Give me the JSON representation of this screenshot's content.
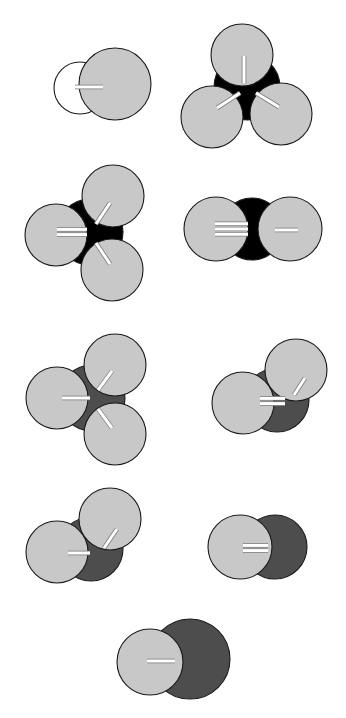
{
  "figure": {
    "background_color": "#ffffff",
    "width": 346,
    "height": 718,
    "palette": {
      "hydrogen_white": "#ffffff",
      "light_gray": "#c8c8c8",
      "dark_gray": "#4d4d4d",
      "black": "#000000",
      "outline": "#1a1a1a",
      "bond_white": "#ffffff",
      "bond_shadow": "#808080"
    },
    "structures": [
      {
        "id": "structure-1",
        "label": "diatomic-white-lightgray",
        "row": 1,
        "column": "left",
        "center_color": "#ffffff",
        "bond_orders": [
          1
        ],
        "atom_count": 2,
        "atoms": [
          {
            "name": "atom-white-left",
            "cx": 80,
            "cy": 88,
            "r": 26,
            "fill": "#ffffff",
            "z": 1
          },
          {
            "name": "atom-lightgray-right",
            "cx": 115,
            "cy": 84,
            "r": 36,
            "fill": "#c8c8c8",
            "z": 2
          }
        ],
        "bonds": [
          {
            "name": "bond-single-right",
            "order": 1,
            "x1": 75,
            "y1": 87,
            "x2": 103,
            "y2": 87,
            "angle": 0
          }
        ]
      },
      {
        "id": "structure-2",
        "label": "black-center-three-lightgray-trigonal",
        "row": 1,
        "column": "right",
        "center_color": "#000000",
        "bond_orders": [
          1,
          1,
          1
        ],
        "atom_count": 4,
        "atoms": [
          {
            "name": "atom-center-black",
            "cx": 247,
            "cy": 87,
            "r": 33,
            "fill": "#000000",
            "z": 1
          },
          {
            "name": "atom-lightgray-top",
            "cx": 242,
            "cy": 55,
            "r": 31,
            "fill": "#c8c8c8",
            "z": 2
          },
          {
            "name": "atom-lightgray-lower-left",
            "cx": 212,
            "cy": 117,
            "r": 31,
            "fill": "#c8c8c8",
            "z": 2
          },
          {
            "name": "atom-lightgray-lower-right",
            "cx": 281,
            "cy": 114,
            "r": 31,
            "fill": "#c8c8c8",
            "z": 2
          }
        ],
        "bonds": [
          {
            "name": "bond-single-top",
            "order": 1,
            "x1": 244,
            "y1": 83,
            "x2": 244,
            "y2": 56,
            "angle": 90
          },
          {
            "name": "bond-single-lower-left",
            "order": 1,
            "x1": 240,
            "y1": 93,
            "x2": 217,
            "y2": 108,
            "angle": 213
          },
          {
            "name": "bond-single-lower-right",
            "order": 1,
            "x1": 256,
            "y1": 93,
            "x2": 279,
            "y2": 107,
            "angle": 328
          }
        ]
      },
      {
        "id": "structure-3",
        "label": "black-center-double-bond-three-lightgray",
        "row": 2,
        "column": "left",
        "center_color": "#000000",
        "bond_orders": [
          2,
          1,
          1
        ],
        "atom_count": 4,
        "atoms": [
          {
            "name": "atom-center-black",
            "cx": 90,
            "cy": 232,
            "r": 33,
            "fill": "#000000",
            "z": 1
          },
          {
            "name": "atom-lightgray-left",
            "cx": 56,
            "cy": 235,
            "r": 31,
            "fill": "#c8c8c8",
            "z": 2
          },
          {
            "name": "atom-lightgray-upper-right",
            "cx": 113,
            "cy": 196,
            "r": 31,
            "fill": "#c8c8c8",
            "z": 2
          },
          {
            "name": "atom-lightgray-lower-right",
            "cx": 112,
            "cy": 270,
            "r": 31,
            "fill": "#c8c8c8",
            "z": 2
          }
        ],
        "bonds": [
          {
            "name": "bond-double-left",
            "order": 2,
            "x1": 57,
            "y1": 232,
            "x2": 87,
            "y2": 232,
            "angle": 180
          },
          {
            "name": "bond-single-upper-right",
            "order": 1,
            "x1": 96,
            "y1": 224,
            "x2": 110,
            "y2": 203,
            "angle": 56
          },
          {
            "name": "bond-single-lower-right",
            "order": 1,
            "x1": 96,
            "y1": 243,
            "x2": 110,
            "y2": 264,
            "angle": 304
          }
        ]
      },
      {
        "id": "structure-4",
        "label": "linear-black-center-triple-and-single",
        "row": 2,
        "column": "right",
        "center_color": "#000000",
        "bond_orders": [
          3,
          1
        ],
        "atom_count": 3,
        "atoms": [
          {
            "name": "atom-center-black",
            "cx": 252,
            "cy": 229,
            "r": 31,
            "fill": "#000000",
            "z": 1
          },
          {
            "name": "atom-lightgray-left",
            "cx": 216,
            "cy": 229,
            "r": 32,
            "fill": "#c8c8c8",
            "z": 2
          },
          {
            "name": "atom-lightgray-right",
            "cx": 290,
            "cy": 229,
            "r": 32,
            "fill": "#c8c8c8",
            "z": 2
          }
        ],
        "bonds": [
          {
            "name": "bond-triple-left",
            "order": 3,
            "x1": 215,
            "y1": 229,
            "x2": 248,
            "y2": 229,
            "angle": 180
          },
          {
            "name": "bond-single-right",
            "order": 1,
            "x1": 275,
            "y1": 230,
            "x2": 298,
            "y2": 230,
            "angle": 0
          }
        ]
      },
      {
        "id": "structure-5",
        "label": "darkgray-center-three-lightgray",
        "row": 3,
        "column": "left",
        "center_color": "#4d4d4d",
        "bond_orders": [
          1,
          1,
          1
        ],
        "atom_count": 4,
        "atoms": [
          {
            "name": "atom-center-darkgray",
            "cx": 92,
            "cy": 398,
            "r": 33,
            "fill": "#4d4d4d",
            "z": 1
          },
          {
            "name": "atom-lightgray-left",
            "cx": 57,
            "cy": 398,
            "r": 31,
            "fill": "#c8c8c8",
            "z": 2
          },
          {
            "name": "atom-lightgray-upper-right",
            "cx": 115,
            "cy": 365,
            "r": 31,
            "fill": "#c8c8c8",
            "z": 2
          },
          {
            "name": "atom-lightgray-lower-right",
            "cx": 115,
            "cy": 434,
            "r": 31,
            "fill": "#c8c8c8",
            "z": 2
          }
        ],
        "bonds": [
          {
            "name": "bond-single-left",
            "order": 1,
            "x1": 62,
            "y1": 398,
            "x2": 90,
            "y2": 398,
            "angle": 180
          },
          {
            "name": "bond-single-upper-right",
            "order": 1,
            "x1": 98,
            "y1": 390,
            "x2": 112,
            "y2": 371,
            "angle": 54
          },
          {
            "name": "bond-single-lower-right",
            "order": 1,
            "x1": 98,
            "y1": 409,
            "x2": 112,
            "y2": 428,
            "angle": 306
          }
        ]
      },
      {
        "id": "structure-6",
        "label": "darkgray-double-bond-two-lightgray",
        "row": 3,
        "column": "right",
        "center_color": "#4d4d4d",
        "bond_orders": [
          2,
          1
        ],
        "atom_count": 3,
        "atoms": [
          {
            "name": "atom-center-darkgray",
            "cx": 277,
            "cy": 400,
            "r": 32,
            "fill": "#4d4d4d",
            "z": 1
          },
          {
            "name": "atom-lightgray-left",
            "cx": 243,
            "cy": 403,
            "r": 31,
            "fill": "#c8c8c8",
            "z": 2
          },
          {
            "name": "atom-lightgray-upper-right",
            "cx": 296,
            "cy": 370,
            "r": 31,
            "fill": "#c8c8c8",
            "z": 2
          }
        ],
        "bonds": [
          {
            "name": "bond-double-left",
            "order": 2,
            "x1": 260,
            "y1": 401,
            "x2": 285,
            "y2": 401,
            "angle": 180
          },
          {
            "name": "bond-single-upper-right",
            "order": 1,
            "x1": 294,
            "y1": 395,
            "x2": 305,
            "y2": 378,
            "angle": 57
          }
        ]
      },
      {
        "id": "structure-7",
        "label": "darkgray-two-lightgray-single-bonds",
        "row": 4,
        "column": "left",
        "center_color": "#4d4d4d",
        "bond_orders": [
          1,
          1
        ],
        "atom_count": 3,
        "atoms": [
          {
            "name": "atom-center-darkgray",
            "cx": 91,
            "cy": 549,
            "r": 32,
            "fill": "#4d4d4d",
            "z": 1
          },
          {
            "name": "atom-lightgray-left",
            "cx": 57,
            "cy": 552,
            "r": 31,
            "fill": "#c8c8c8",
            "z": 2
          },
          {
            "name": "atom-lightgray-upper-right",
            "cx": 110,
            "cy": 519,
            "r": 31,
            "fill": "#c8c8c8",
            "z": 2
          }
        ],
        "bonds": [
          {
            "name": "bond-single-left",
            "order": 1,
            "x1": 68,
            "y1": 553,
            "x2": 90,
            "y2": 553,
            "angle": 180
          },
          {
            "name": "bond-single-upper-right",
            "order": 1,
            "x1": 104,
            "y1": 548,
            "x2": 117,
            "y2": 529,
            "angle": 56
          }
        ]
      },
      {
        "id": "structure-8",
        "label": "lightgray-darkgray-double-bond",
        "row": 4,
        "column": "right",
        "center_color": "#4d4d4d",
        "bond_orders": [
          2
        ],
        "atom_count": 2,
        "atoms": [
          {
            "name": "atom-darkgray-right",
            "cx": 275,
            "cy": 547,
            "r": 32,
            "fill": "#4d4d4d",
            "z": 1
          },
          {
            "name": "atom-lightgray-left",
            "cx": 240,
            "cy": 547,
            "r": 32,
            "fill": "#c8c8c8",
            "z": 2
          }
        ],
        "bonds": [
          {
            "name": "bond-double-center",
            "order": 2,
            "x1": 243,
            "y1": 548,
            "x2": 268,
            "y2": 548,
            "angle": 0
          }
        ]
      },
      {
        "id": "structure-9",
        "label": "lightgray-darkgray-single-bond-large",
        "row": 5,
        "column": "center",
        "center_color": "#4d4d4d",
        "bond_orders": [
          1
        ],
        "atom_count": 2,
        "atoms": [
          {
            "name": "atom-darkgray-right",
            "cx": 190,
            "cy": 659,
            "r": 40,
            "fill": "#4d4d4d",
            "z": 1
          },
          {
            "name": "atom-lightgray-left",
            "cx": 150,
            "cy": 662,
            "r": 33,
            "fill": "#c8c8c8",
            "z": 2
          }
        ],
        "bonds": [
          {
            "name": "bond-single-center",
            "order": 1,
            "x1": 147,
            "y1": 661,
            "x2": 175,
            "y2": 661,
            "angle": 0
          }
        ]
      }
    ]
  }
}
